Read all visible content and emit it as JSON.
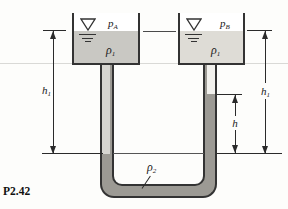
{
  "figure": {
    "label": "P2.42"
  },
  "labels": {
    "pressure_a": {
      "main": "p",
      "sub": "A"
    },
    "pressure_b": {
      "main": "p",
      "sub": "B"
    },
    "rho1_left": {
      "main": "ρ",
      "sub": "1"
    },
    "rho1_right": {
      "main": "ρ",
      "sub": "1"
    },
    "rho2": {
      "main": "ρ",
      "sub": "2"
    },
    "dim_h1_left": {
      "main": "h",
      "sub": "1"
    },
    "dim_h1_right": {
      "main": "h",
      "sub": "1"
    },
    "dim_h": {
      "main": "h",
      "sub": ""
    }
  },
  "colors": {
    "fluid_rho1_left_tank": "#c9c8c3",
    "fluid_rho1_right_tank": "#dedcd6",
    "fluid_rho2": "#9c9a94",
    "tube_wall": "#333333",
    "dimension_line": "#2a2a2a",
    "background": "#fdfdfb"
  }
}
